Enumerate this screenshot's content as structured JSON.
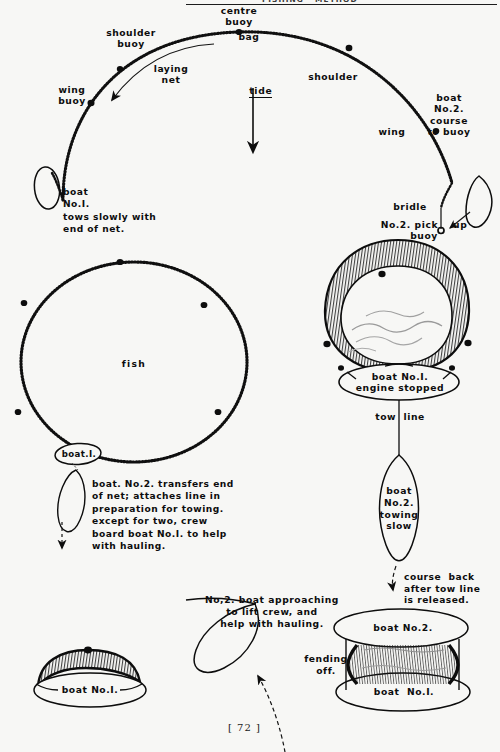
{
  "document": {
    "page_number": "[ 72 ]",
    "header_fragment": "FISHING   METHOD",
    "paper_color": "#f7f7f5",
    "ink_color": "#0d0d0d"
  },
  "figure": {
    "labels": {
      "centre_buoy": "centre\nbuoy",
      "bag": "bag",
      "shoulder_buoy": "shoulder\nbuoy",
      "shoulder": "shoulder",
      "wing_buoy": "wing\nbuoy",
      "wing": "wing",
      "laying_net": "laying\nnet",
      "tide": "tide",
      "boat_no2_course": "boat\nNo.2.\ncourse\nto buoy",
      "bridle": "bridle",
      "pick_up_buoy": "No.2. pick    up\nbuoy",
      "boat_no1_tows": "boat\nNo.I.\ntows slowly with\nend of net.",
      "fish": "fish",
      "boat_1_ring": "boat.I.",
      "boat_no1_engine_stopped": "boat No.I.\nengine stopped",
      "tow_line": "tow  line",
      "boat_no2_towing_slow": "boat\nNo.2.\ntowing\nslow",
      "transfer_note": "boat. No.2. transfers end\nof net; attaches line in\npreparation for towing.\nexcept for two, crew\nboard boat No.I. to help\nwith hauling.",
      "course_back": "course  back\nafter tow line\nis released.",
      "approach_note": "No,2. boat approaching\nto lift crew, and\nhelp with hauling.",
      "boat_no2_bottom": "boat No.2.",
      "fending_off": "fending\noff.",
      "boat_no1_bottom_right": "boat  No.I.",
      "boat_no1_bottom_left": "boat No.I."
    }
  }
}
